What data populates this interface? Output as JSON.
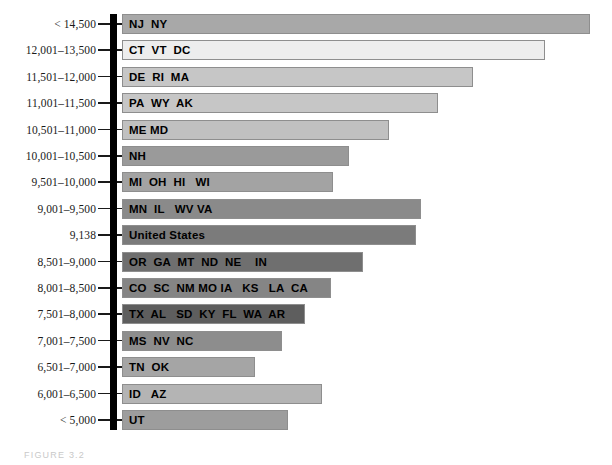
{
  "figure": {
    "caption": "FIGURE 3.2"
  },
  "chart_data": {
    "type": "bar",
    "orientation": "horizontal",
    "title": "",
    "subtitle": "",
    "xlabel": "",
    "ylabel": "",
    "grid": false,
    "legend": "none",
    "axis": {
      "style": "thick-vertical-spine",
      "color": "#000000",
      "tick_style": "dash"
    },
    "value_unit": "dollars per capita",
    "categories": [
      "< 14,500",
      "12,001–13,500",
      "11,501–12,000",
      "11,001–11,500",
      "10,501–11,000",
      "10,001–10,500",
      "9,501–10,000",
      "9,001–9,500",
      "9,138",
      "8,501–9,000",
      "8,001–8,500",
      "7,501–8,000",
      "7,001–7,500",
      "6,501–7,000",
      "6,001–6,500",
      "< 5,000"
    ],
    "values": [
      14500,
      13500,
      12000,
      11500,
      11000,
      10500,
      10000,
      9500,
      9138,
      9000,
      8500,
      8000,
      7500,
      7000,
      6500,
      5000
    ],
    "bar_labels": [
      "NJ  NY",
      "CT  VT  DC",
      "DE  RI  MA",
      "PA  WY  AK",
      "ME MD",
      "NH",
      "MI  OH  HI   WI",
      "MN  IL   WV VA",
      "United States",
      "OR  GA  MT  ND  NE    IN",
      "CO  SC  NM MO IA   KS   LA  CA",
      "TX  AL   SD  KY  FL  WA  AR",
      "MS  NV  NC",
      "TN  OK",
      "ID   AZ",
      "UT"
    ],
    "bar_pixel_widths": [
      468,
      423,
      351,
      316,
      267,
      227,
      211,
      299,
      294,
      241,
      209,
      183,
      160,
      133,
      200,
      166
    ],
    "bar_colors": [
      "#a8a8a8",
      "#ededed",
      "#c6c6c6",
      "#c6c6c6",
      "#c0c0c0",
      "#9a9a9a",
      "#a3a3a3",
      "#8a8a8a",
      "#7b7b7b",
      "#6f6f6f",
      "#858585",
      "#5e5e5e",
      "#8d8d8d",
      "#a5a5a5",
      "#b4b4b4",
      "#9d9d9d"
    ],
    "xlim": [
      0,
      14500
    ],
    "ylim": null
  }
}
